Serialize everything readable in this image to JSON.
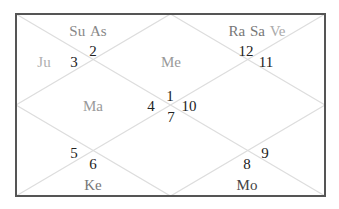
{
  "chart": {
    "title": "",
    "style": "North Indian diamond chart",
    "colors": {
      "frame": "#555555",
      "diagonals": "#dddddd",
      "house_numbers": "#222222",
      "planet_dark": "#444444",
      "planet_medium": "#777777",
      "planet_light": "#aaaaaa"
    },
    "frame": {
      "left": 16,
      "top": 14,
      "right": 325,
      "bottom": 196
    },
    "house_numbers": [
      {
        "value": "1",
        "x": 170,
        "y": 96
      },
      {
        "value": "2",
        "x": 93,
        "y": 51
      },
      {
        "value": "3",
        "x": 74,
        "y": 62
      },
      {
        "value": "4",
        "x": 151,
        "y": 106
      },
      {
        "value": "5",
        "x": 74,
        "y": 153
      },
      {
        "value": "6",
        "x": 93,
        "y": 164
      },
      {
        "value": "7",
        "x": 171,
        "y": 117
      },
      {
        "value": "8",
        "x": 247,
        "y": 164
      },
      {
        "value": "9",
        "x": 265,
        "y": 153
      },
      {
        "value": "10",
        "x": 189,
        "y": 106
      },
      {
        "value": "11",
        "x": 266,
        "y": 62
      },
      {
        "value": "12",
        "x": 246,
        "y": 51
      }
    ],
    "planets": [
      {
        "house": 2,
        "x": 88,
        "y": 31,
        "names": [
          {
            "label": "Su",
            "color": "#888888"
          },
          {
            "label": "As",
            "color": "#888888"
          }
        ]
      },
      {
        "house": 3,
        "x": 44,
        "y": 62,
        "names": [
          {
            "label": "Ju",
            "color": "#b0b0b0"
          }
        ]
      },
      {
        "house": 1,
        "x": 171,
        "y": 62,
        "names": [
          {
            "label": "Me",
            "color": "#999999"
          }
        ]
      },
      {
        "house": 12,
        "x": 257,
        "y": 31,
        "names": [
          {
            "label": "Ra",
            "color": "#777777"
          },
          {
            "label": "Sa",
            "color": "#777777"
          },
          {
            "label": "Ve",
            "color": "#aaaaaa"
          }
        ]
      },
      {
        "house": 4,
        "x": 93,
        "y": 106,
        "names": [
          {
            "label": "Ma",
            "color": "#999999"
          }
        ]
      },
      {
        "house": 6,
        "x": 93,
        "y": 185,
        "names": [
          {
            "label": "Ke",
            "color": "#777777"
          }
        ]
      },
      {
        "house": 8,
        "x": 247,
        "y": 185,
        "names": [
          {
            "label": "Mo",
            "color": "#444444"
          }
        ]
      }
    ]
  }
}
